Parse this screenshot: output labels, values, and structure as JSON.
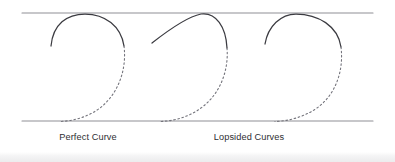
{
  "figure": {
    "type": "diagram",
    "background_color": "#ffffff",
    "canvas": {
      "width": 395,
      "height": 162
    },
    "guide_lines": {
      "color": "#8f9096",
      "stroke_width": 1.1,
      "x_start": 22,
      "x_end": 373,
      "top_y": 13,
      "bottom_y": 121,
      "count": 2
    },
    "curve_style": {
      "solid_color": "#3b3b41",
      "dashed_color": "#74747c",
      "solid_stroke_width": 1.25,
      "dashed_stroke_width": 1.1,
      "dash_pattern": "1.6 2.6"
    },
    "curves": [
      {
        "id": "curve-1",
        "label": "Perfect Curve",
        "kind": "perfect",
        "symmetry": "symmetric",
        "apex": {
          "x": 85,
          "y": 14
        },
        "solid_start": {
          "x": 51,
          "y": 46
        },
        "solid_end": {
          "x": 124,
          "y": 46
        },
        "dashed_end": {
          "x": 60,
          "y": 121
        },
        "solid_path": "M 51 46 C 53 24 67 14 85 14 C 105 14 121 26 124 46",
        "dashed_path": "M 124 46 C 127 70 118 94 100 108 C 88 117 73 121 60 121.5"
      },
      {
        "id": "curve-2",
        "label": "Lopsided Curve (peak right)",
        "kind": "lopsided",
        "symmetry": "skewed-right",
        "apex": {
          "x": 201,
          "y": 14
        },
        "solid_start": {
          "x": 152,
          "y": 43
        },
        "solid_end": {
          "x": 227,
          "y": 48
        },
        "dashed_end": {
          "x": 160,
          "y": 121
        },
        "solid_path": "M 152 43 C 166 32 186 17 201 14 C 216 12 226 27 227 48",
        "dashed_path": "M 227 48 C 229 72 219 95 201 108 C 189 117 174 121 160 121.5"
      },
      {
        "id": "curve-3",
        "label": "Lopsided Curve (peak left)",
        "kind": "lopsided",
        "symmetry": "skewed-left",
        "apex": {
          "x": 296,
          "y": 14
        },
        "solid_start": {
          "x": 265,
          "y": 44
        },
        "solid_end": {
          "x": 341,
          "y": 47
        },
        "dashed_end": {
          "x": 275,
          "y": 121
        },
        "solid_path": "M 265 44 C 268 26 281 14 296 14 C 318 14 338 26 341 47",
        "dashed_path": "M 341 47 C 344 72 335 95 317 108 C 304 117 289 121 275 121.5"
      }
    ]
  },
  "captions": {
    "perfect": "Perfect Curve",
    "lopsided": "Lopsided Curves"
  }
}
